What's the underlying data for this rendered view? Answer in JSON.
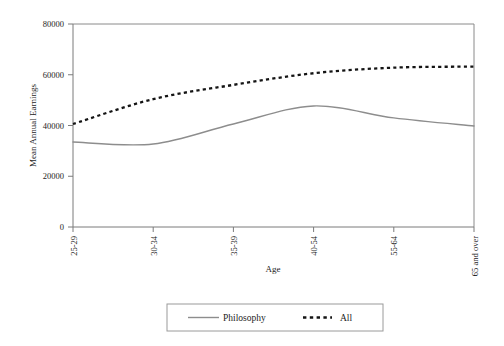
{
  "chart_data": {
    "type": "line",
    "title": "",
    "xlabel": "Age",
    "ylabel": "Mean Annual Earnings",
    "categories": [
      "25-29",
      "30-34",
      "35-39",
      "40-54",
      "55-64",
      "65 and over"
    ],
    "series": [
      {
        "name": "Philosophy",
        "style": "solid",
        "color": "#8d8d8d",
        "values": [
          33500,
          32700,
          40600,
          47700,
          43000,
          39800
        ]
      },
      {
        "name": "All",
        "style": "dashed",
        "color": "#141414",
        "values": [
          40600,
          50400,
          56000,
          60600,
          62800,
          63200
        ]
      }
    ],
    "ylim": [
      0,
      80000
    ],
    "yticks": [
      0,
      20000,
      40000,
      60000,
      80000
    ],
    "ytick_labels": [
      "0",
      "20000",
      "40000",
      "60000",
      "80000"
    ],
    "xtick_labels": [
      "25-29",
      "30-34",
      "35-39",
      "40-54",
      "55-64",
      "65 and over"
    ],
    "xtick_rotation": 90,
    "grid": false,
    "legend_position": "bottom-center",
    "legend_entries": [
      "Philosophy",
      "All"
    ]
  },
  "axes": {
    "y_title": "Mean Annual Earnings",
    "x_title": "Age",
    "y_ticks": [
      "80000",
      "60000",
      "40000",
      "20000",
      "0"
    ],
    "x_ticks": [
      "25-29",
      "30-34",
      "35-39",
      "40-54",
      "55-64",
      "65 and over"
    ]
  },
  "legend": {
    "philosophy_label": "Philosophy",
    "all_label": "All"
  },
  "colors": {
    "philosophy": "#8d8d8d",
    "all": "#141414",
    "axis": "#7b7b7b",
    "background": "#ffffff"
  }
}
